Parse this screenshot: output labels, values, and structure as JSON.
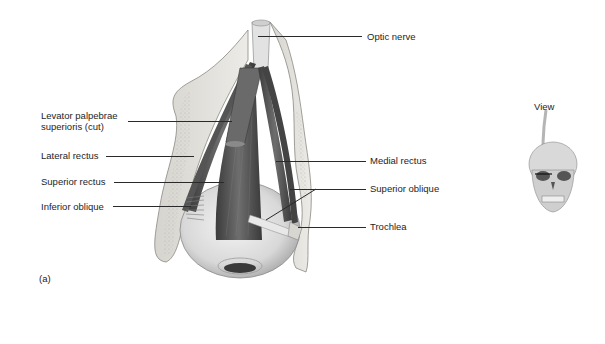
{
  "figure": {
    "panel_label": "(a)",
    "view_label": "View",
    "labels_left": [
      {
        "id": "levator",
        "line1": "Levator palpebrae",
        "line2": "superioris (cut)"
      },
      {
        "id": "lateral-rectus",
        "text": "Lateral rectus"
      },
      {
        "id": "superior-rectus",
        "text": "Superior rectus"
      },
      {
        "id": "inferior-oblique",
        "text": "Inferior oblique"
      }
    ],
    "labels_right": [
      {
        "id": "optic-nerve",
        "text": "Optic nerve"
      },
      {
        "id": "medial-rectus",
        "text": "Medial rectus"
      },
      {
        "id": "superior-oblique",
        "text": "Superior oblique"
      },
      {
        "id": "trochlea",
        "text": "Trochlea"
      }
    ],
    "colors": {
      "bone": "#e4e2dc",
      "bone_stipple": "#bdbab2",
      "muscle_dark": "#4a4a4a",
      "muscle_mid": "#7a7a7a",
      "eyeball": "#dcdcdc",
      "leader_line": "#2a2a2a"
    }
  }
}
